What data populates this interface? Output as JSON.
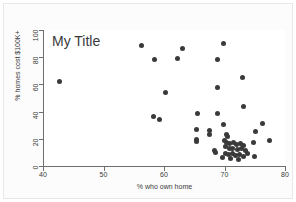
{
  "chart_data": {
    "type": "scatter",
    "title": "My Title",
    "xlabel": "% who own home",
    "ylabel": "% homes cost $100K+",
    "xlim": [
      40,
      80
    ],
    "ylim": [
      0,
      100
    ],
    "xticks": [
      40,
      50,
      60,
      70,
      80
    ],
    "yticks": [
      0,
      20,
      40,
      60,
      80,
      100
    ],
    "grid": false,
    "legend": null,
    "marker_color": "#3a3a3a",
    "points": [
      {
        "x": 42.8,
        "y": 62.2
      },
      {
        "x": 56.2,
        "y": 88.3
      },
      {
        "x": 58.5,
        "y": 78.3
      },
      {
        "x": 62.3,
        "y": 78.9
      },
      {
        "x": 63.0,
        "y": 86.2
      },
      {
        "x": 69.9,
        "y": 90.3
      },
      {
        "x": 68.9,
        "y": 78.4
      },
      {
        "x": 73.0,
        "y": 64.9
      },
      {
        "x": 68.8,
        "y": 57.5
      },
      {
        "x": 60.2,
        "y": 54.2
      },
      {
        "x": 73.2,
        "y": 44.0
      },
      {
        "x": 58.3,
        "y": 36.5
      },
      {
        "x": 59.3,
        "y": 34.3
      },
      {
        "x": 65.5,
        "y": 38.5
      },
      {
        "x": 68.8,
        "y": 38.6
      },
      {
        "x": 69.8,
        "y": 30.8
      },
      {
        "x": 76.3,
        "y": 31.3
      },
      {
        "x": 65.4,
        "y": 26.6
      },
      {
        "x": 67.6,
        "y": 26.2
      },
      {
        "x": 67.5,
        "y": 23.0
      },
      {
        "x": 75.2,
        "y": 25.2
      },
      {
        "x": 65.4,
        "y": 19.5
      },
      {
        "x": 65.4,
        "y": 17.7
      },
      {
        "x": 70.3,
        "y": 23.4
      },
      {
        "x": 70.5,
        "y": 21.5
      },
      {
        "x": 77.5,
        "y": 19.0
      },
      {
        "x": 74.8,
        "y": 17.5
      },
      {
        "x": 68.3,
        "y": 11.6
      },
      {
        "x": 68.5,
        "y": 9.8
      },
      {
        "x": 70.0,
        "y": 19.0
      },
      {
        "x": 70.4,
        "y": 17.6
      },
      {
        "x": 70.9,
        "y": 16.5
      },
      {
        "x": 71.5,
        "y": 17.0
      },
      {
        "x": 72.0,
        "y": 15.8
      },
      {
        "x": 72.6,
        "y": 16.2
      },
      {
        "x": 73.2,
        "y": 15.0
      },
      {
        "x": 70.2,
        "y": 14.0
      },
      {
        "x": 70.8,
        "y": 12.8
      },
      {
        "x": 71.4,
        "y": 13.2
      },
      {
        "x": 72.1,
        "y": 12.0
      },
      {
        "x": 72.8,
        "y": 12.6
      },
      {
        "x": 73.5,
        "y": 11.4
      },
      {
        "x": 70.1,
        "y": 9.5
      },
      {
        "x": 70.7,
        "y": 8.4
      },
      {
        "x": 71.3,
        "y": 9.0
      },
      {
        "x": 71.9,
        "y": 7.8
      },
      {
        "x": 72.5,
        "y": 8.2
      },
      {
        "x": 73.1,
        "y": 7.0
      },
      {
        "x": 73.8,
        "y": 9.2
      },
      {
        "x": 74.9,
        "y": 7.2
      },
      {
        "x": 69.6,
        "y": 6.6
      },
      {
        "x": 71.0,
        "y": 5.4
      },
      {
        "x": 72.3,
        "y": 5.0
      }
    ]
  }
}
